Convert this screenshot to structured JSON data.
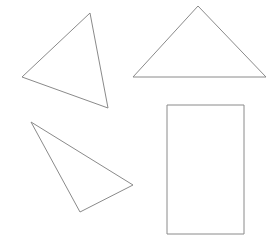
{
  "canvas": {
    "width": 279,
    "height": 249,
    "background_color": "#ffffff",
    "stroke_color": "#8a8a8a",
    "stroke_width": 1,
    "fill": "none",
    "title": "Four geometric outline shapes"
  },
  "shapes": [
    {
      "id": "triangle-upper-left",
      "name": "Upper-left scalene triangle",
      "type": "triangle",
      "points": "90,13 108,108 22,77",
      "vertices": [
        [
          90,
          13
        ],
        [
          108,
          108
        ],
        [
          22,
          77
        ]
      ]
    },
    {
      "id": "triangle-upper-right",
      "name": "Upper-right isosceles triangle",
      "type": "triangle",
      "points": "198,6 266,77 133,77",
      "vertices": [
        [
          198,
          6
        ],
        [
          266,
          77
        ],
        [
          133,
          77
        ]
      ]
    },
    {
      "id": "triangle-lower-left",
      "name": "Lower-left thin triangle",
      "type": "triangle",
      "points": "31,122 133,185 80,212",
      "vertices": [
        [
          31,
          122
        ],
        [
          133,
          185
        ],
        [
          80,
          212
        ]
      ]
    },
    {
      "id": "rectangle-lower-right",
      "name": "Lower-right rectangle",
      "type": "rectangle",
      "points": "167,105 244,105 244,234 167,234",
      "vertices": [
        [
          167,
          105
        ],
        [
          244,
          105
        ],
        [
          244,
          234
        ],
        [
          167,
          234
        ]
      ]
    }
  ]
}
